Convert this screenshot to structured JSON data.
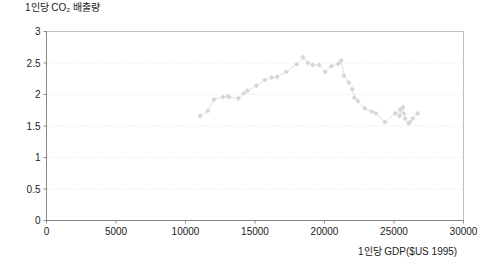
{
  "chart_data": {
    "type": "scatter",
    "title": "",
    "ylabel": "1인당 CO₂ 배출량",
    "xlabel": "1인당 GDP($US 1995)",
    "xlim": [
      0,
      30000
    ],
    "ylim": [
      0,
      3
    ],
    "xticks": [
      "0",
      "5000",
      "10000",
      "15000",
      "20000",
      "25000",
      "30000"
    ],
    "xtick_values": [
      0,
      5000,
      10000,
      15000,
      20000,
      25000,
      30000
    ],
    "yticks": [
      "0",
      "0.5",
      "1",
      "1.5",
      "2",
      "2.5",
      "3"
    ],
    "ytick_values": [
      0,
      0.5,
      1,
      1.5,
      2,
      2.5,
      3
    ],
    "grid": "horizontal",
    "legend": "none",
    "marker_color": "#d6d6d6",
    "line_color": "#dcdcdc",
    "series": [
      {
        "name": "1인당 CO₂ 배출량",
        "points": [
          [
            11050,
            1.66
          ],
          [
            11600,
            1.74
          ],
          [
            12050,
            1.92
          ],
          [
            12700,
            1.96
          ],
          [
            13050,
            1.97
          ],
          [
            13150,
            1.96
          ],
          [
            13800,
            1.94
          ],
          [
            14200,
            2.02
          ],
          [
            14450,
            2.06
          ],
          [
            15100,
            2.14
          ],
          [
            15700,
            2.23
          ],
          [
            16200,
            2.27
          ],
          [
            16600,
            2.28
          ],
          [
            17250,
            2.36
          ],
          [
            18000,
            2.48
          ],
          [
            18450,
            2.59
          ],
          [
            18800,
            2.5
          ],
          [
            19150,
            2.47
          ],
          [
            19600,
            2.47
          ],
          [
            20050,
            2.36
          ],
          [
            20500,
            2.45
          ],
          [
            21000,
            2.49
          ],
          [
            21200,
            2.54
          ],
          [
            21400,
            2.3
          ],
          [
            21750,
            2.19
          ],
          [
            22000,
            2.08
          ],
          [
            22150,
            1.95
          ],
          [
            22400,
            1.9
          ],
          [
            22900,
            1.78
          ],
          [
            23400,
            1.73
          ],
          [
            23700,
            1.7
          ],
          [
            24350,
            1.56
          ],
          [
            25100,
            1.7
          ],
          [
            25450,
            1.76
          ],
          [
            25400,
            1.66
          ],
          [
            25650,
            1.8
          ],
          [
            25700,
            1.7
          ],
          [
            25800,
            1.62
          ],
          [
            26050,
            1.54
          ],
          [
            26150,
            1.56
          ],
          [
            26350,
            1.62
          ],
          [
            26700,
            1.7
          ]
        ]
      }
    ]
  }
}
